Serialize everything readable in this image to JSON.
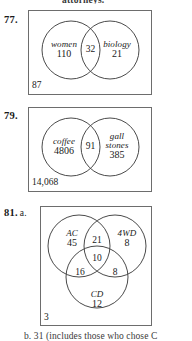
{
  "page": {
    "top_fragment": "attorneys.",
    "bottom_fragment": "b. 31 (includes those who chose C"
  },
  "exercises": [
    {
      "number": "77.",
      "part": "",
      "outside_count": "87",
      "diagram": {
        "type": "two-circle-venn",
        "left": {
          "category": "women",
          "count": "110"
        },
        "right": {
          "category": "biology",
          "count": "21"
        },
        "intersection": {
          "count": "32"
        }
      }
    },
    {
      "number": "79.",
      "part": "",
      "outside_count": "14,068",
      "diagram": {
        "type": "two-circle-venn",
        "left": {
          "category": "coffee",
          "count": "4806"
        },
        "right": {
          "category_line1": "gall",
          "category_line2": "stones",
          "count": "385"
        },
        "intersection": {
          "count": "91"
        }
      }
    },
    {
      "number": "81.",
      "part": "a.",
      "outside_count": "3",
      "diagram": {
        "type": "three-circle-venn",
        "top_left": {
          "category": "AC",
          "count": "45"
        },
        "top_right": {
          "category": "4WD",
          "count": "8"
        },
        "bottom": {
          "category": "CD",
          "count": "12"
        },
        "top_pair": {
          "count": "21"
        },
        "left_pair": {
          "count": "16"
        },
        "right_pair": {
          "count": "8"
        },
        "center": {
          "count": "10"
        }
      }
    }
  ]
}
